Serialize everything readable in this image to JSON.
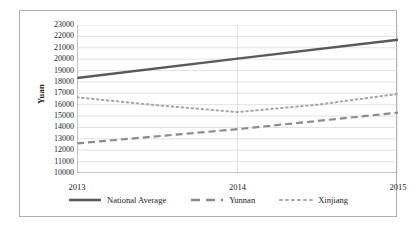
{
  "chart_data": {
    "type": "line",
    "title": "",
    "xlabel": "",
    "ylabel": "Yuan",
    "categories": [
      "2013",
      "2014",
      "2015"
    ],
    "x_tick_labels": [
      "2013",
      "2014",
      "2015"
    ],
    "y_tick_labels": [
      "23000",
      "22000",
      "21000",
      "20000",
      "19000",
      "18000",
      "17000",
      "16000",
      "15000",
      "14000",
      "13000",
      "12000",
      "11000",
      "10000"
    ],
    "ylim": [
      10000,
      23000
    ],
    "y_tick_step": 1000,
    "grid": "horizontal-and-vertical",
    "legend_position": "bottom-center",
    "series": [
      {
        "name": "National Average",
        "style": "solid",
        "color": "#595959",
        "x": [
          "2013",
          "2014",
          "2015"
        ],
        "values": [
          18350,
          20050,
          21700
        ]
      },
      {
        "name": "Yunnan",
        "style": "dashed",
        "color": "#8c8c8c",
        "x": [
          "2013",
          "2014",
          "2015"
        ],
        "values": [
          12600,
          13850,
          15300
        ]
      },
      {
        "name": "Xinjiang",
        "style": "dotted",
        "color": "#a6a6a6",
        "x": [
          "2013",
          "2013.5",
          "2014",
          "2014.5",
          "2015"
        ],
        "values": [
          16650,
          15950,
          15350,
          16000,
          16950
        ],
        "note": "dips between 2013 and 2014 then rises"
      }
    ]
  },
  "legend": {
    "items": [
      {
        "label": "National Average",
        "style": "solid",
        "color": "#595959"
      },
      {
        "label": "Yunnan",
        "style": "dashed",
        "color": "#8c8c8c"
      },
      {
        "label": "Xinjiang",
        "style": "dotted",
        "color": "#a6a6a6"
      }
    ]
  },
  "colors": {
    "frame": "#b0b0b0",
    "grid": "#d9d9d9",
    "axis": "#9a9a9a",
    "text": "#1c1c1c",
    "background": "#ffffff"
  }
}
